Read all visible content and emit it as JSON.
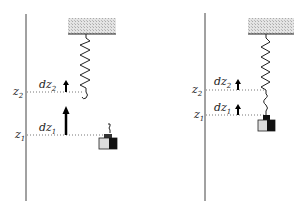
{
  "panels": [
    {
      "name": "left",
      "labels": {
        "z_upper": "z",
        "z_upper_sub": "2",
        "z_lower": "z",
        "z_lower_sub": "1",
        "dz_upper": "dz",
        "dz_upper_sub": "2",
        "dz_lower": "dz",
        "dz_lower_sub": "1"
      }
    },
    {
      "name": "right",
      "labels": {
        "z_upper": "z",
        "z_upper_sub": "2",
        "z_lower": "z",
        "z_lower_sub": "1",
        "dz_upper": "dz",
        "dz_upper_sub": "2",
        "dz_lower": "dz",
        "dz_lower_sub": "1"
      }
    }
  ],
  "colors": {
    "line": "#333333",
    "ceiling_fill": "#d8d8d8",
    "dotted": "#777777"
  }
}
